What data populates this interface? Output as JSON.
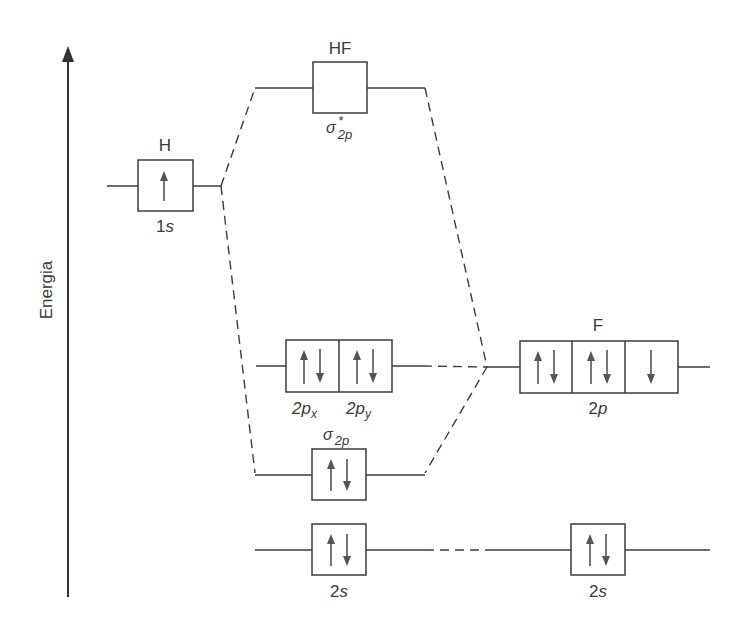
{
  "diagram": {
    "axis": {
      "label": "Energia",
      "direction": "up"
    },
    "atoms": {
      "H": {
        "label": "H",
        "orbitals": [
          {
            "name": "1s",
            "electrons": [
              "up"
            ]
          }
        ]
      },
      "F": {
        "label": "F",
        "orbitals": [
          {
            "name": "2p",
            "boxes": [
              [
                "up",
                "down"
              ],
              [
                "up",
                "down"
              ],
              [
                "down"
              ]
            ]
          },
          {
            "name": "2s",
            "electrons": [
              "up",
              "down"
            ]
          }
        ]
      }
    },
    "molecule": {
      "label": "HF",
      "orbitals": [
        {
          "name": "σ*2p",
          "symbol": "σ",
          "star": "*",
          "sub": "2p",
          "electrons": []
        },
        {
          "name": "2px",
          "base": "2p",
          "sub": "x",
          "electrons": [
            "up",
            "down"
          ]
        },
        {
          "name": "2py",
          "base": "2p",
          "sub": "y",
          "electrons": [
            "up",
            "down"
          ]
        },
        {
          "name": "σ2p",
          "symbol": "σ",
          "sub": "2p",
          "electrons": [
            "up",
            "down"
          ]
        },
        {
          "name": "2s",
          "electrons": [
            "up",
            "down"
          ]
        }
      ]
    },
    "labels": {
      "h_atom": "H",
      "h_1s": "1",
      "h_1s_s": "s",
      "hf": "HF",
      "sigma_star_symbol": "σ",
      "sigma_star_star": "*",
      "sigma_star_sub": "2p",
      "px_base": "2p",
      "px_sub": "x",
      "py_base": "2p",
      "py_sub": "y",
      "f_atom": "F",
      "f_2p_num": "2",
      "f_2p_p": "p",
      "sigma_symbol": "σ",
      "sigma_sub": "2p",
      "mol_2s_num": "2",
      "mol_2s_s": "s",
      "f_2s_num": "2",
      "f_2s_s": "s"
    },
    "colors": {
      "line": "#3c3c3c",
      "arrow": "#555555",
      "text": "#3a3a3a"
    }
  }
}
